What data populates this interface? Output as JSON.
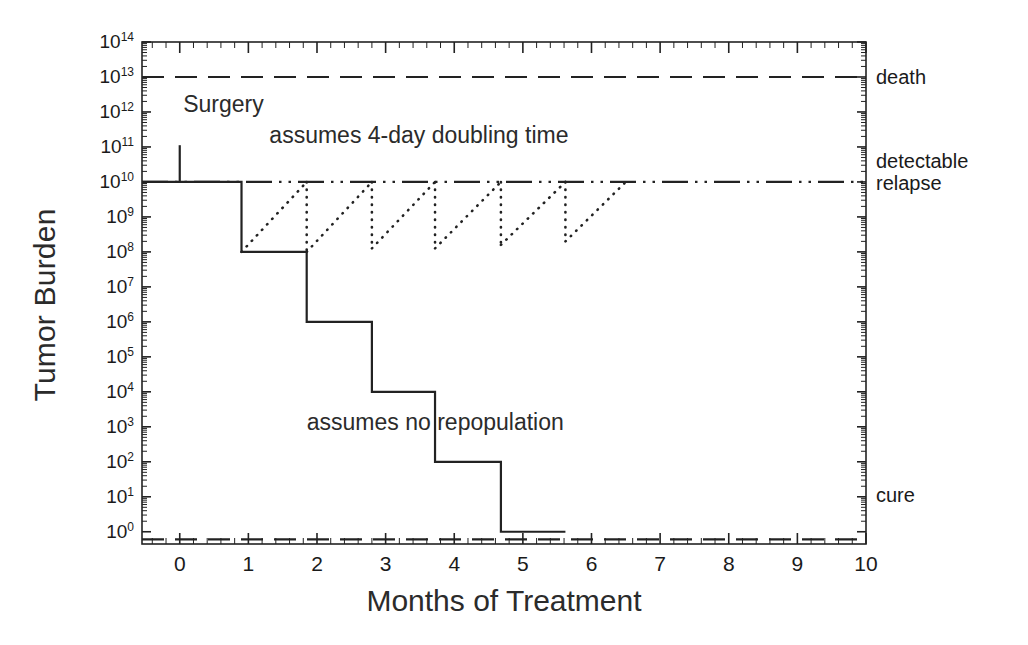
{
  "chart_data": {
    "type": "line",
    "title": "",
    "xlabel": "Months of Treatment",
    "ylabel": "Tumor Burden",
    "xlim": [
      -0.55,
      10
    ],
    "ylim_exponent": [
      -0.35,
      14
    ],
    "grid": false,
    "legend_position": "none",
    "x_ticks": [
      "0",
      "1",
      "2",
      "3",
      "4",
      "5",
      "6",
      "7",
      "8",
      "9",
      "10"
    ],
    "y_tick_exponents": [
      0,
      1,
      2,
      3,
      4,
      5,
      6,
      7,
      8,
      9,
      10,
      11,
      12,
      13,
      14
    ],
    "y_tick_labels": [
      "10<sup>0</sup>",
      "10<sup>1</sup>",
      "10<sup>2</sup>",
      "10<sup>3</sup>",
      "10<sup>4</sup>",
      "10<sup>5</sup>",
      "10<sup>6</sup>",
      "10<sup>7</sup>",
      "10<sup>8</sup>",
      "10<sup>9</sup>",
      "10<sup>10</sup>",
      "10<sup>11</sup>",
      "10<sup>12</sup>",
      "10<sup>13</sup>",
      "10<sup>14</sup>"
    ],
    "reference_lines": [
      {
        "name": "death",
        "label": "death",
        "y_exponent": 13,
        "style": "dashed"
      },
      {
        "name": "detectable-relapse",
        "label": "detectable\nrelapse",
        "label_line1": "detectable",
        "label_line2": "relapse",
        "y_exponent": 10,
        "style": "dash-dot-dot"
      },
      {
        "name": "cure",
        "label": "cure",
        "y_exponent": -0.22,
        "style": "dashed"
      }
    ],
    "series": [
      {
        "name": "surgery-spike",
        "style": "solid",
        "points_xy_exponent": [
          [
            0,
            11.05
          ],
          [
            0,
            10
          ]
        ]
      },
      {
        "name": "no-repopulation-step",
        "style": "solid",
        "description": "stepwise log-kill of tumor burden with no regrowth between cycles",
        "points_xy_exponent": [
          [
            -0.55,
            10
          ],
          [
            0.9,
            10
          ],
          [
            0.9,
            8
          ],
          [
            1.85,
            8
          ],
          [
            1.85,
            6
          ],
          [
            2.8,
            6
          ],
          [
            2.8,
            4
          ],
          [
            3.72,
            4
          ],
          [
            3.72,
            2
          ],
          [
            4.68,
            2
          ],
          [
            4.68,
            0
          ],
          [
            5.62,
            0
          ]
        ]
      },
      {
        "name": "repopulation-sawtooth",
        "style": "dotted",
        "description": "regrowth at 4-day doubling time back to detectable relapse between each treatment cycle",
        "cycles": [
          {
            "x_start": 0.9,
            "y_start_exponent": 8.0,
            "x_end": 1.85,
            "y_end_exponent": 10
          },
          {
            "x_start": 1.85,
            "y_start_exponent": 8.0,
            "x_end": 2.8,
            "y_end_exponent": 10
          },
          {
            "x_start": 2.8,
            "y_start_exponent": 8.1,
            "x_end": 3.72,
            "y_end_exponent": 10
          },
          {
            "x_start": 3.72,
            "y_start_exponent": 8.1,
            "x_end": 4.68,
            "y_end_exponent": 10
          },
          {
            "x_start": 4.68,
            "y_start_exponent": 8.2,
            "x_end": 5.62,
            "y_end_exponent": 10
          },
          {
            "x_start": 5.62,
            "y_start_exponent": 8.3,
            "x_end": 6.5,
            "y_end_exponent": 10
          }
        ]
      }
    ],
    "annotations": [
      {
        "name": "surgery",
        "text": "Surgery",
        "x": 0.05,
        "y_exponent": 12.2
      },
      {
        "name": "doubling-time",
        "text": "assumes 4-day doubling time",
        "x": 3.2,
        "y_exponent": 11.3
      },
      {
        "name": "no-repopulation",
        "text": "assumes no repopulation",
        "x": 3.6,
        "y_exponent": 3.1
      }
    ],
    "colors": {
      "axis": "#222222",
      "line": "#222222",
      "text": "#1a1a1a",
      "background": "#ffffff"
    }
  }
}
